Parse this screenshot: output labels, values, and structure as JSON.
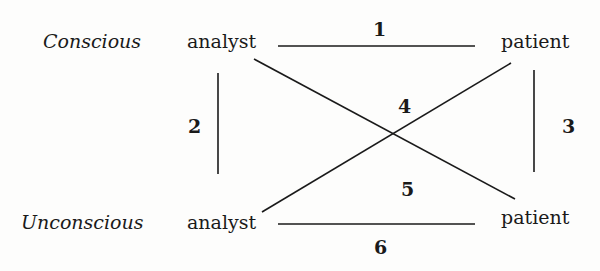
{
  "diagram": {
    "type": "relationship-square",
    "rows": [
      {
        "label": "Conscious"
      },
      {
        "label": "Unconscious"
      }
    ],
    "nodes": {
      "conscious_analyst": "analyst",
      "conscious_patient": "patient",
      "unconscious_analyst": "analyst",
      "unconscious_patient": "patient"
    },
    "edges": [
      {
        "id": "1",
        "from": "conscious_analyst",
        "to": "conscious_patient"
      },
      {
        "id": "2",
        "from": "conscious_analyst",
        "to": "unconscious_analyst"
      },
      {
        "id": "3",
        "from": "conscious_patient",
        "to": "unconscious_patient"
      },
      {
        "id": "4",
        "from": "unconscious_analyst",
        "to": "conscious_patient"
      },
      {
        "id": "5",
        "from": "conscious_analyst",
        "to": "unconscious_patient"
      },
      {
        "id": "6",
        "from": "unconscious_analyst",
        "to": "unconscious_patient"
      }
    ],
    "line_color": "#1a1a1a"
  }
}
